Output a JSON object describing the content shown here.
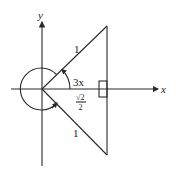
{
  "diagram": {
    "axes": {
      "x_label": "x",
      "y_label": "y"
    },
    "triangle": {
      "upper_side_label": "1",
      "lower_side_label": "1",
      "adjacent_label_numerator": "√2",
      "adjacent_label_denominator": "2",
      "right_angle_marker": true
    },
    "angles": {
      "upper_angle_label": "3x",
      "full_circle_arc": true
    },
    "colors": {
      "stroke": "#2a2a2a",
      "background": "#ffffff"
    }
  }
}
